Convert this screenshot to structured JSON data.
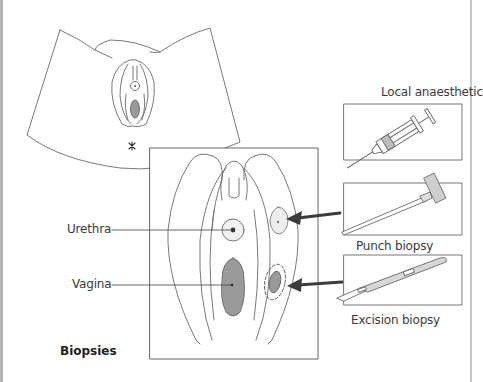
{
  "figure": {
    "title": "Biopsies",
    "overview_view": "Perineal overview of external genitalia",
    "inset_view": "Magnified vulva with biopsy sites",
    "anatomy_labels": {
      "urethra": "Urethra",
      "vagina": "Vagina"
    },
    "instruments": [
      {
        "id": "syringe",
        "label": "Local anaesthetic"
      },
      {
        "id": "punch",
        "label": "Punch biopsy"
      },
      {
        "id": "scalpel",
        "label": "Excision biopsy"
      }
    ],
    "colors": {
      "line": "#555555",
      "fill_dark": "#9a9a9a",
      "fill_light": "#ececec",
      "arrow": "#3c3c3c",
      "instrument_shade": "#c9c9c9"
    }
  }
}
